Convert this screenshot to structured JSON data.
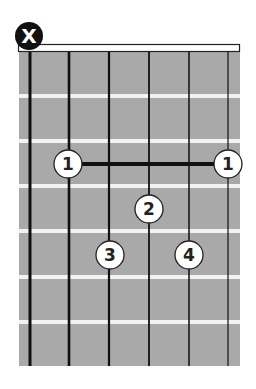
{
  "chord": {
    "muted_string_marker": "X",
    "muted_string": 6,
    "strings_x": [
      30,
      69,
      109,
      149,
      189,
      228
    ],
    "frets_y": [
      96,
      141,
      186,
      231,
      277,
      322
    ],
    "board": {
      "x": 19,
      "y": 52,
      "width": 221,
      "height": 314
    },
    "nut": {
      "x": 18,
      "y": 44,
      "width": 222,
      "height": 8
    },
    "barre": {
      "fret": 1,
      "from_x": 68,
      "to_x": 228,
      "y": 164,
      "finger": "1"
    },
    "fingers": [
      {
        "label": "1",
        "string": 5,
        "fret": 1,
        "cx": 68,
        "cy": 164
      },
      {
        "label": "1",
        "string": 1,
        "fret": 1,
        "cx": 228,
        "cy": 164
      },
      {
        "label": "2",
        "string": 3,
        "fret": 2,
        "cx": 149,
        "cy": 209
      },
      {
        "label": "3",
        "string": 4,
        "fret": 3,
        "cx": 110,
        "cy": 255
      },
      {
        "label": "4",
        "string": 2,
        "fret": 3,
        "cx": 189,
        "cy": 255
      }
    ],
    "colors": {
      "board": "#a9a9a9",
      "fret": "#f2f2f2",
      "string": "#111111",
      "dot_fill": "#ffffff",
      "dot_stroke": "#222222",
      "muted_fill": "#111111"
    }
  }
}
